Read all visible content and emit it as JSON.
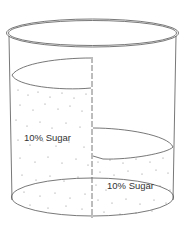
{
  "diagram": {
    "type": "beaker-with-membrane",
    "left_compartment": {
      "label": "10% Sugar",
      "level": "high"
    },
    "right_compartment": {
      "label": "10% Sugar",
      "level": "low"
    },
    "colors": {
      "stroke": "#555555",
      "dots": "#777777",
      "background": "#ffffff"
    }
  }
}
